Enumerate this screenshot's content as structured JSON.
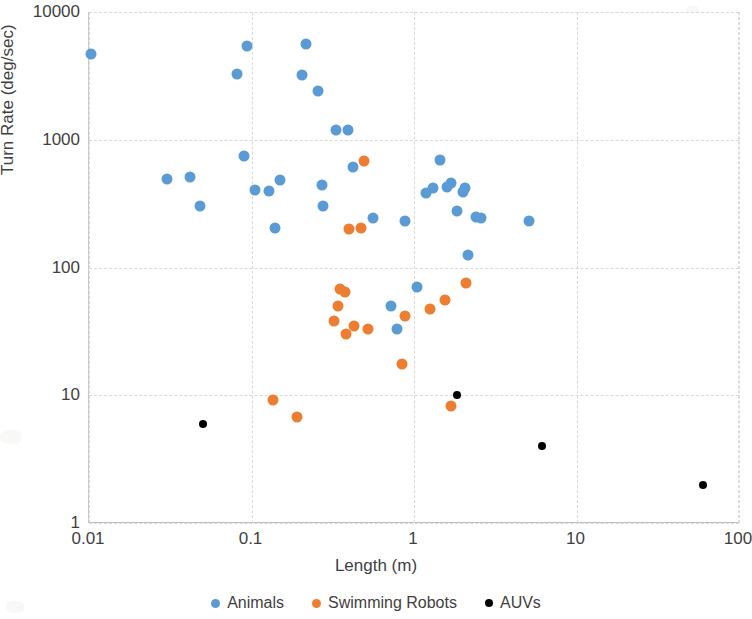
{
  "chart_data": {
    "type": "scatter",
    "title": "",
    "xlabel": "Length (m)",
    "ylabel": "Turn Rate (deg/sec)",
    "xscale": "log",
    "yscale": "log",
    "xlim": [
      0.01,
      100
    ],
    "ylim": [
      1,
      10000
    ],
    "xticks": [
      "0.01",
      "0.1",
      "1",
      "10",
      "100"
    ],
    "xtick_values": [
      0.01,
      0.1,
      1,
      10,
      100
    ],
    "yticks": [
      "1",
      "10",
      "100",
      "1000",
      "10000"
    ],
    "ytick_values": [
      1,
      10,
      100,
      1000,
      10000
    ],
    "grid": true,
    "legend_position": "bottom",
    "series": [
      {
        "name": "Animals",
        "color": "#5B9BD5",
        "points": [
          [
            0.0103,
            4700
          ],
          [
            0.03,
            490
          ],
          [
            0.042,
            510
          ],
          [
            0.048,
            305
          ],
          [
            0.082,
            3300
          ],
          [
            0.09,
            740
          ],
          [
            0.094,
            5400
          ],
          [
            0.105,
            405
          ],
          [
            0.128,
            400
          ],
          [
            0.14,
            205
          ],
          [
            0.15,
            485
          ],
          [
            0.205,
            3200
          ],
          [
            0.215,
            5600
          ],
          [
            0.255,
            2400
          ],
          [
            0.27,
            440
          ],
          [
            0.275,
            305
          ],
          [
            0.33,
            1200
          ],
          [
            0.395,
            1200
          ],
          [
            0.42,
            610
          ],
          [
            0.56,
            245
          ],
          [
            0.72,
            50
          ],
          [
            0.79,
            33
          ],
          [
            0.88,
            230
          ],
          [
            1.05,
            70
          ],
          [
            1.18,
            380
          ],
          [
            1.3,
            420
          ],
          [
            1.45,
            690
          ],
          [
            1.6,
            430
          ],
          [
            1.7,
            460
          ],
          [
            1.85,
            275
          ],
          [
            2.0,
            390
          ],
          [
            2.05,
            420
          ],
          [
            2.15,
            125
          ],
          [
            2.4,
            250
          ],
          [
            2.6,
            245
          ],
          [
            5.1,
            230
          ]
        ]
      },
      {
        "name": "Swimming Robots",
        "color": "#ED7D31",
        "points": [
          [
            0.135,
            9.2
          ],
          [
            0.19,
            6.8
          ],
          [
            0.32,
            38
          ],
          [
            0.34,
            50
          ],
          [
            0.35,
            68
          ],
          [
            0.375,
            64
          ],
          [
            0.38,
            30
          ],
          [
            0.4,
            200
          ],
          [
            0.425,
            35
          ],
          [
            0.47,
            205
          ],
          [
            0.49,
            680
          ],
          [
            0.52,
            33
          ],
          [
            0.84,
            17.5
          ],
          [
            0.88,
            42
          ],
          [
            1.25,
            47
          ],
          [
            1.55,
            56
          ],
          [
            1.7,
            8.2
          ],
          [
            2.1,
            75
          ]
        ]
      },
      {
        "name": "AUVs",
        "color": "#000000",
        "points": [
          [
            0.05,
            6.0
          ],
          [
            1.85,
            10.0
          ],
          [
            6.1,
            4.0
          ],
          [
            60.0,
            2.0
          ]
        ]
      }
    ]
  },
  "legend": {
    "items": [
      {
        "label": "Animals",
        "key": "animals"
      },
      {
        "label": "Swimming Robots",
        "key": "robots"
      },
      {
        "label": "AUVs",
        "key": "auvs"
      }
    ]
  }
}
